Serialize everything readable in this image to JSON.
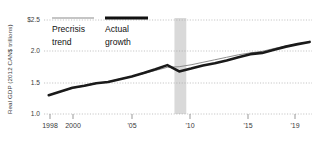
{
  "chart_data": {
    "type": "line",
    "title": "",
    "xlabel": "",
    "ylabel": "Real GDP (2012 CAN$ trillions)",
    "xlim": [
      1997.6,
      2020.2
    ],
    "ylim": [
      1.0,
      2.5
    ],
    "grid": true,
    "legend_position": "top-left-inside",
    "ytick_labels": [
      "$2.5",
      "2.0",
      "1.5",
      "1.0"
    ],
    "ytick_values": [
      2.5,
      2.0,
      1.5,
      1.0
    ],
    "xtick_labels": [
      "1998",
      "2000",
      "'05",
      "'10",
      "'15",
      "'19"
    ],
    "xtick_values": [
      1998,
      2000,
      2005,
      2010,
      2015,
      2019
    ],
    "annotations": [
      {
        "name": "recession-band",
        "label": "",
        "x_start": 2008.6,
        "x_end": 2009.6
      }
    ],
    "series": [
      {
        "name": "Precrisis trend",
        "color": "#8c8c8c",
        "style": "thin",
        "x": [
          1998,
          1999,
          2000,
          2001,
          2002,
          2003,
          2004,
          2005,
          2006,
          2007,
          2008,
          2009,
          2010,
          2011,
          2012,
          2013,
          2014,
          2015,
          2016,
          2017,
          2018,
          2019,
          2020
        ],
        "values": [
          1.3,
          1.355,
          1.41,
          1.445,
          1.485,
          1.515,
          1.56,
          1.6,
          1.645,
          1.695,
          1.745,
          1.755,
          1.785,
          1.825,
          1.865,
          1.905,
          1.945,
          1.975,
          2.0,
          2.045,
          2.085,
          2.12,
          2.15
        ]
      },
      {
        "name": "Actual growth",
        "color": "#1a1a1a",
        "style": "thick",
        "x": [
          1998,
          1999,
          2000,
          2001,
          2002,
          2003,
          2004,
          2005,
          2006,
          2007,
          2008,
          2009,
          2010,
          2011,
          2012,
          2013,
          2014,
          2015,
          2016,
          2017,
          2018,
          2019,
          2020
        ],
        "values": [
          1.3,
          1.36,
          1.42,
          1.45,
          1.49,
          1.51,
          1.555,
          1.6,
          1.655,
          1.715,
          1.78,
          1.68,
          1.725,
          1.775,
          1.81,
          1.855,
          1.905,
          1.955,
          1.975,
          2.025,
          2.075,
          2.115,
          2.15
        ]
      }
    ]
  },
  "legend": {
    "items": [
      {
        "label_line1": "Precrisis",
        "label_line2": "trend",
        "swatch": "thin-gray-line"
      },
      {
        "label_line1": "Actual",
        "label_line2": "growth",
        "swatch": "thick-black-line"
      }
    ]
  },
  "colors": {
    "actual": "#1a1a1a",
    "trend": "#8c8c8c",
    "recession_band": "#d9d9d9",
    "grid": "#9a9a9a",
    "background": "#ffffff"
  }
}
